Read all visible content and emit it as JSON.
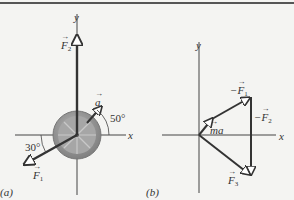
{
  "panel_a": {
    "caption": "(a)",
    "axis_x": "x",
    "axis_y": "y",
    "forces": [
      {
        "name": "F",
        "sub": "2",
        "direction": "up"
      },
      {
        "name": "F",
        "sub": "1",
        "angle_below_negative_x": "30°"
      }
    ],
    "acceleration": {
      "name": "a",
      "angle_from_x": "50°"
    },
    "angle_a": "50°",
    "angle_f1": "30°"
  },
  "panel_b": {
    "caption": "(b)",
    "axis_x": "x",
    "axis_y": "y",
    "vectors": [
      {
        "label_prefix": "",
        "name": "ma"
      },
      {
        "label_prefix": "−",
        "name": "F",
        "sub": "1"
      },
      {
        "label_prefix": "−",
        "name": "F",
        "sub": "2"
      },
      {
        "label_prefix": "",
        "name": "F",
        "sub": "3"
      }
    ]
  },
  "colors": {
    "line": "#3a3a3a",
    "wheel": "#9a9a9a",
    "background": "#f4f4f2"
  }
}
